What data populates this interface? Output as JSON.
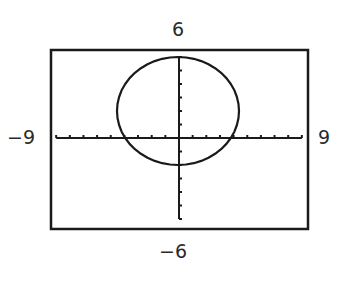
{
  "window": {
    "ymax_label": "6",
    "ymin_label": "−6",
    "xmin_label": "−9",
    "xmax_label": "9"
  },
  "chart_data": {
    "type": "line",
    "title": "",
    "xlabel": "",
    "ylabel": "",
    "xlim": [
      -9,
      9
    ],
    "ylim": [
      -6,
      6
    ],
    "xscale": 1,
    "yscale": 1,
    "grid": false,
    "axes_ticks": true,
    "legend": null,
    "series": [
      {
        "name": "circle",
        "shape": "circle",
        "center": [
          0,
          2
        ],
        "radius": 4,
        "equation": "x^2 + (y - 2)^2 = 16",
        "extents": {
          "top": 6,
          "bottom": -2,
          "left": -4,
          "right": 4
        }
      }
    ],
    "annotations": [
      "6",
      "-6",
      "-9",
      "9"
    ]
  },
  "colors": {
    "stroke": "#1a1a1a",
    "frame": "#1a1a1a",
    "background": "#ffffff"
  }
}
